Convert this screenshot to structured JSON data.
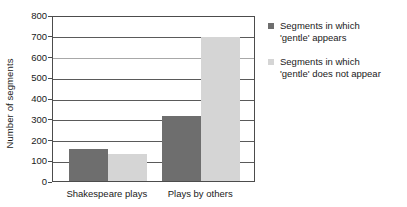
{
  "chart_data": {
    "type": "bar",
    "title": "",
    "xlabel": "",
    "ylabel": "Number of segments",
    "categories": [
      "Shakespeare plays",
      "Plays by others"
    ],
    "series": [
      {
        "name": "Segments in which 'gentle' appears",
        "name_line1": "Segments in which",
        "name_line2": "'gentle' appears",
        "color": "#6e6e6e",
        "values": [
          155,
          315
        ]
      },
      {
        "name": "Segments in which 'gentle' does not appear",
        "name_line1": "Segments in which",
        "name_line2": "'gentle' does not appear",
        "color": "#d5d5d5",
        "values": [
          130,
          695
        ]
      }
    ],
    "ylim": [
      0,
      800
    ],
    "y_ticks": [
      0,
      100,
      200,
      300,
      400,
      500,
      600,
      700,
      800
    ],
    "y_tick_labels": [
      "0",
      "100",
      "200",
      "300",
      "400",
      "500",
      "600",
      "700",
      "800"
    ],
    "grid": true,
    "legend_position": "right"
  }
}
